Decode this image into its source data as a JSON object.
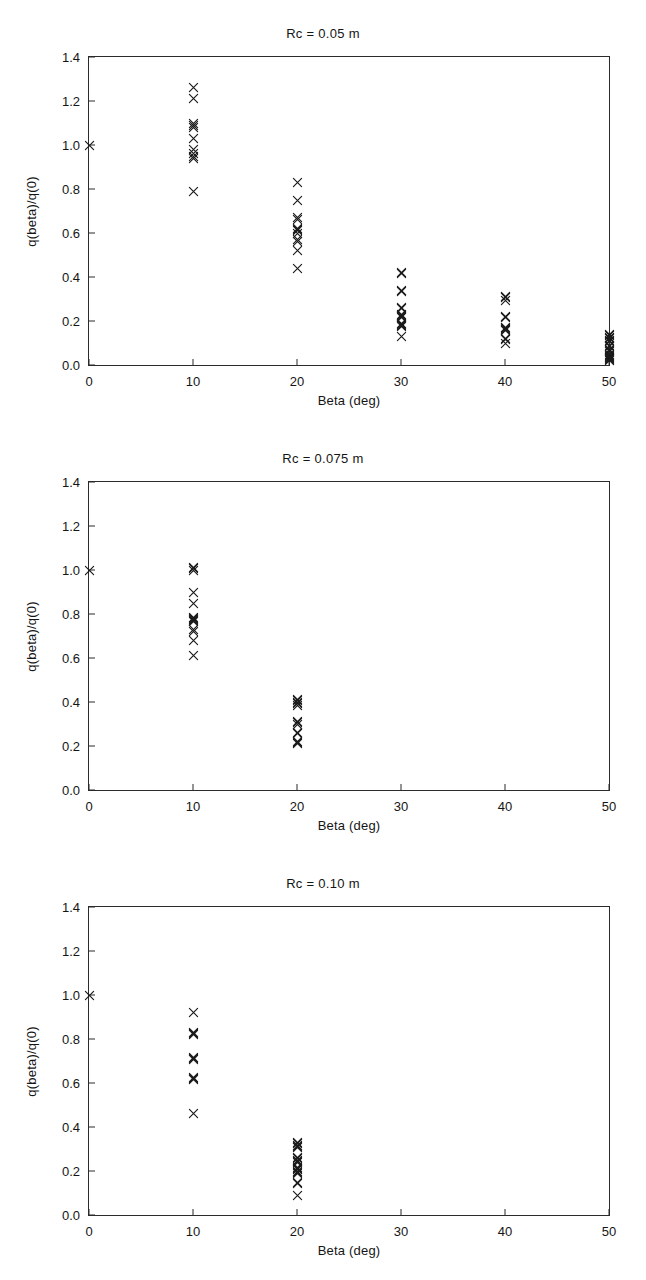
{
  "figure": {
    "kind": "scatter-panel-series",
    "panel_count": 3,
    "axis": {
      "xlabel": "Beta (deg)",
      "ylabel": "q(beta)/q(0)",
      "xticks": [
        "0",
        "10",
        "20",
        "30",
        "40",
        "50"
      ],
      "yticks": [
        "0.0",
        "0.2",
        "0.4",
        "0.6",
        "0.8",
        "1.0",
        "1.2",
        "1.4"
      ],
      "xlim": [
        0,
        50
      ],
      "ylim": [
        0,
        1.4
      ],
      "marker": "x-cross-marker",
      "marker_color": "#1a1a1a",
      "grid": false,
      "legend": false
    }
  },
  "chart_data": [
    {
      "type": "scatter",
      "title": "Rc = 0.05 m",
      "xlabel": "Beta (deg)",
      "ylabel": "q(beta)/q(0)",
      "xlim": [
        0,
        50
      ],
      "ylim": [
        0,
        1.4
      ],
      "xticks": [
        0,
        10,
        20,
        30,
        40,
        50
      ],
      "yticks": [
        0.0,
        0.2,
        0.4,
        0.6,
        0.8,
        1.0,
        1.2,
        1.4
      ],
      "grid": false,
      "legend": false,
      "points": [
        [
          0,
          1.0
        ],
        [
          10,
          1.26
        ],
        [
          10,
          1.21
        ],
        [
          10,
          1.1
        ],
        [
          10,
          1.09
        ],
        [
          10,
          1.08
        ],
        [
          10,
          1.03
        ],
        [
          10,
          0.98
        ],
        [
          10,
          0.96
        ],
        [
          10,
          0.95
        ],
        [
          10,
          0.94
        ],
        [
          10,
          0.79
        ],
        [
          20,
          0.83
        ],
        [
          20,
          0.75
        ],
        [
          20,
          0.67
        ],
        [
          20,
          0.66
        ],
        [
          20,
          0.62
        ],
        [
          20,
          0.615
        ],
        [
          20,
          0.61
        ],
        [
          20,
          0.6
        ],
        [
          20,
          0.57
        ],
        [
          20,
          0.56
        ],
        [
          20,
          0.52
        ],
        [
          20,
          0.44
        ],
        [
          30,
          0.42
        ],
        [
          30,
          0.415
        ],
        [
          30,
          0.34
        ],
        [
          30,
          0.335
        ],
        [
          30,
          0.26
        ],
        [
          30,
          0.255
        ],
        [
          30,
          0.23
        ],
        [
          30,
          0.225
        ],
        [
          30,
          0.22
        ],
        [
          30,
          0.215
        ],
        [
          30,
          0.19
        ],
        [
          30,
          0.185
        ],
        [
          30,
          0.18
        ],
        [
          30,
          0.175
        ],
        [
          30,
          0.13
        ],
        [
          40,
          0.31
        ],
        [
          40,
          0.305
        ],
        [
          40,
          0.295
        ],
        [
          40,
          0.22
        ],
        [
          40,
          0.215
        ],
        [
          40,
          0.17
        ],
        [
          40,
          0.165
        ],
        [
          40,
          0.16
        ],
        [
          40,
          0.155
        ],
        [
          40,
          0.12
        ],
        [
          40,
          0.115
        ],
        [
          40,
          0.1
        ],
        [
          50,
          0.14
        ],
        [
          50,
          0.135
        ],
        [
          50,
          0.125
        ],
        [
          50,
          0.12
        ],
        [
          50,
          0.11
        ],
        [
          50,
          0.105
        ],
        [
          50,
          0.09
        ],
        [
          50,
          0.085
        ],
        [
          50,
          0.07
        ],
        [
          50,
          0.065
        ],
        [
          50,
          0.06
        ],
        [
          50,
          0.05
        ],
        [
          50,
          0.045
        ],
        [
          50,
          0.04
        ],
        [
          50,
          0.035
        ],
        [
          50,
          0.03
        ],
        [
          50,
          0.025
        ],
        [
          50,
          0.02
        ]
      ]
    },
    {
      "type": "scatter",
      "title": "Rc = 0.075 m",
      "xlabel": "Beta (deg)",
      "ylabel": "q(beta)/q(0)",
      "xlim": [
        0,
        50
      ],
      "ylim": [
        0,
        1.4
      ],
      "xticks": [
        0,
        10,
        20,
        30,
        40,
        50
      ],
      "yticks": [
        0.0,
        0.2,
        0.4,
        0.6,
        0.8,
        1.0,
        1.2,
        1.4
      ],
      "grid": false,
      "legend": false,
      "points": [
        [
          0,
          1.0
        ],
        [
          10,
          1.01
        ],
        [
          10,
          1.005
        ],
        [
          10,
          1.0
        ],
        [
          10,
          0.9
        ],
        [
          10,
          0.85
        ],
        [
          10,
          0.785
        ],
        [
          10,
          0.78
        ],
        [
          10,
          0.775
        ],
        [
          10,
          0.77
        ],
        [
          10,
          0.765
        ],
        [
          10,
          0.73
        ],
        [
          10,
          0.72
        ],
        [
          10,
          0.68
        ],
        [
          10,
          0.61
        ],
        [
          20,
          0.41
        ],
        [
          20,
          0.405
        ],
        [
          20,
          0.4
        ],
        [
          20,
          0.395
        ],
        [
          20,
          0.385
        ],
        [
          20,
          0.31
        ],
        [
          20,
          0.305
        ],
        [
          20,
          0.3
        ],
        [
          20,
          0.26
        ],
        [
          20,
          0.255
        ],
        [
          20,
          0.22
        ],
        [
          20,
          0.215
        ],
        [
          20,
          0.21
        ]
      ]
    },
    {
      "type": "scatter",
      "title": "Rc = 0.10 m",
      "xlabel": "Beta (deg)",
      "ylabel": "q(beta)/q(0)",
      "xlim": [
        0,
        50
      ],
      "ylim": [
        0,
        1.4
      ],
      "xticks": [
        0,
        10,
        20,
        30,
        40,
        50
      ],
      "yticks": [
        0.0,
        0.2,
        0.4,
        0.6,
        0.8,
        1.0,
        1.2,
        1.4
      ],
      "grid": false,
      "legend": false,
      "points": [
        [
          0,
          1.0
        ],
        [
          10,
          0.92
        ],
        [
          10,
          0.83
        ],
        [
          10,
          0.825
        ],
        [
          10,
          0.82
        ],
        [
          10,
          0.715
        ],
        [
          10,
          0.71
        ],
        [
          10,
          0.705
        ],
        [
          10,
          0.625
        ],
        [
          10,
          0.62
        ],
        [
          10,
          0.615
        ],
        [
          10,
          0.46
        ],
        [
          20,
          0.33
        ],
        [
          20,
          0.325
        ],
        [
          20,
          0.315
        ],
        [
          20,
          0.31
        ],
        [
          20,
          0.305
        ],
        [
          20,
          0.26
        ],
        [
          20,
          0.255
        ],
        [
          20,
          0.25
        ],
        [
          20,
          0.245
        ],
        [
          20,
          0.24
        ],
        [
          20,
          0.215
        ],
        [
          20,
          0.21
        ],
        [
          20,
          0.205
        ],
        [
          20,
          0.2
        ],
        [
          20,
          0.195
        ],
        [
          20,
          0.19
        ],
        [
          20,
          0.15
        ],
        [
          20,
          0.145
        ],
        [
          20,
          0.09
        ]
      ]
    }
  ]
}
